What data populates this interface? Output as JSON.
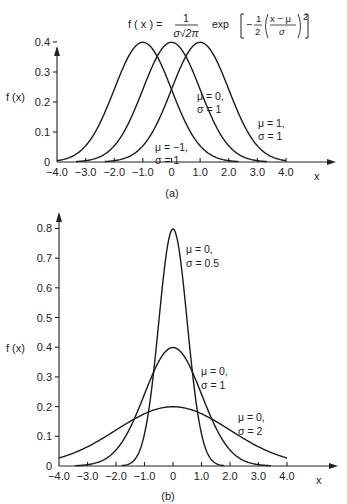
{
  "formula": {
    "lhs": "f ( x ) =",
    "num": "1",
    "den": "σ√2π",
    "exp": "exp",
    "inner": "−½((x − μ)/σ)²"
  },
  "chart_data": [
    {
      "id": "a",
      "type": "line",
      "caption": "(a)",
      "title": "f(x) = 1/(σ√(2π)) exp[−½((x−μ)/σ)²]",
      "xlabel": "x",
      "ylabel": "f (x)",
      "xlim": [
        -4.0,
        4.0
      ],
      "ylim": [
        0,
        0.4
      ],
      "x_ticks": [
        "−4.0",
        "−3.0",
        "−2.0",
        "−1.0",
        "0",
        "1.0",
        "2.0",
        "3.0",
        "4.0"
      ],
      "y_ticks": [
        "0",
        "0.1",
        "0.2",
        "0.3",
        "0.4"
      ],
      "grid": false,
      "series": [
        {
          "name": "μ = −1, σ = 1",
          "mu": -1,
          "sigma": 1,
          "label_line1": "μ = −1,",
          "label_line2": "σ = 1",
          "peak": 0.399
        },
        {
          "name": "μ = 0, σ = 1",
          "mu": 0,
          "sigma": 1,
          "label_line1": "μ = 0,",
          "label_line2": "σ = 1",
          "peak": 0.399
        },
        {
          "name": "μ = 1, σ = 1",
          "mu": 1,
          "sigma": 1,
          "label_line1": "μ = 1,",
          "label_line2": "σ = 1",
          "peak": 0.399
        }
      ]
    },
    {
      "id": "b",
      "type": "line",
      "caption": "(b)",
      "xlabel": "x",
      "ylabel": "f (x)",
      "xlim": [
        -4.0,
        4.0
      ],
      "ylim": [
        0,
        0.8
      ],
      "x_ticks": [
        "−4.0",
        "−3.0",
        "−2.0",
        "−1.0",
        "0",
        "1.0",
        "2.0",
        "3.0",
        "4.0"
      ],
      "y_ticks": [
        "0",
        "0.1",
        "0.2",
        "0.3",
        "0.4",
        "0.5",
        "0.6",
        "0.7",
        "0.8"
      ],
      "grid": false,
      "series": [
        {
          "name": "μ = 0, σ = 0.5",
          "mu": 0,
          "sigma": 0.5,
          "label_line1": "μ = 0,",
          "label_line2": "σ = 0.5",
          "peak": 0.798
        },
        {
          "name": "μ = 0, σ = 1",
          "mu": 0,
          "sigma": 1,
          "label_line1": "μ = 0,",
          "label_line2": "σ = 1",
          "peak": 0.399
        },
        {
          "name": "μ = 0, σ = 2",
          "mu": 0,
          "sigma": 2,
          "label_line1": "μ = 0,",
          "label_line2": "σ = 2",
          "peak": 0.199
        }
      ]
    }
  ]
}
